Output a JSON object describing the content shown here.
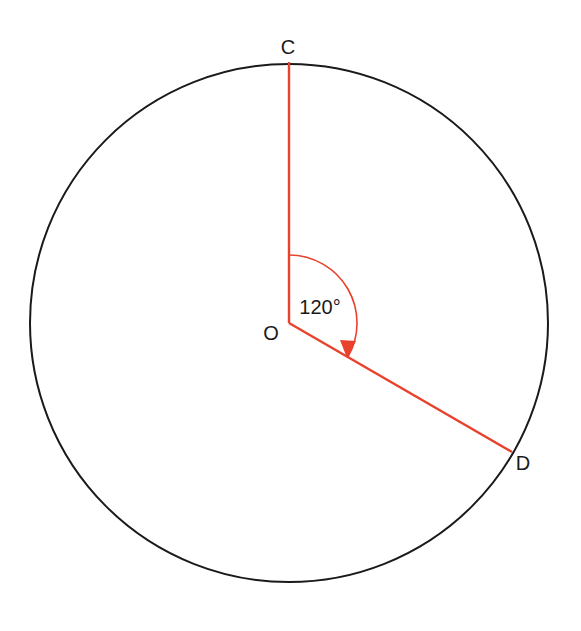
{
  "diagram": {
    "type": "circle-angle",
    "colors": {
      "circle": "#1a1a1a",
      "radius_lines": "#e8412c",
      "labels": "#1a1a1a"
    },
    "circle": {
      "cx": 289,
      "cy": 323,
      "r": 259
    },
    "points": {
      "C": {
        "label": "C"
      },
      "O": {
        "label": "O"
      },
      "D": {
        "label": "D"
      }
    },
    "angle": {
      "label": "120°",
      "value_degrees": 120
    }
  }
}
